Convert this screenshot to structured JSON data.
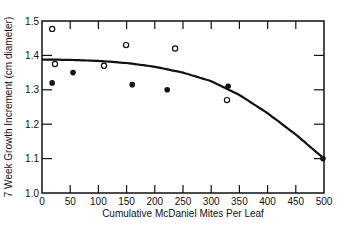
{
  "chart_data": {
    "type": "scatter",
    "title": "",
    "xlabel": "Cumulative McDaniel Mites Per Leaf",
    "ylabel": "7 Week Growth Increment (cm diameter)",
    "xlim": [
      0,
      500
    ],
    "ylim": [
      1.0,
      1.5
    ],
    "x_ticks": [
      0,
      50,
      100,
      150,
      200,
      250,
      300,
      350,
      400,
      450,
      500
    ],
    "y_ticks": [
      1.0,
      1.1,
      1.2,
      1.3,
      1.4,
      1.5
    ],
    "y_tick_labels": [
      "1.0",
      "1.1",
      "1.2",
      "1.3",
      "1.4",
      "1.5"
    ],
    "grid": false,
    "legend": null,
    "series": [
      {
        "name": "open circles",
        "marker": "open-circle",
        "points": [
          [
            18,
            1.477
          ],
          [
            23,
            1.375
          ],
          [
            110,
            1.37
          ],
          [
            149,
            1.43
          ],
          [
            236,
            1.42
          ],
          [
            328,
            1.27
          ]
        ]
      },
      {
        "name": "filled circles",
        "marker": "filled-circle",
        "points": [
          [
            18,
            1.32
          ],
          [
            55,
            1.35
          ],
          [
            160,
            1.315
          ],
          [
            222,
            1.3
          ],
          [
            330,
            1.31
          ],
          [
            498,
            1.1
          ]
        ]
      },
      {
        "name": "fitted curve",
        "type": "line",
        "points": [
          [
            0,
            1.388
          ],
          [
            50,
            1.387
          ],
          [
            100,
            1.384
          ],
          [
            150,
            1.378
          ],
          [
            200,
            1.367
          ],
          [
            250,
            1.35
          ],
          [
            300,
            1.325
          ],
          [
            350,
            1.285
          ],
          [
            400,
            1.232
          ],
          [
            450,
            1.17
          ],
          [
            500,
            1.1
          ]
        ]
      }
    ]
  }
}
